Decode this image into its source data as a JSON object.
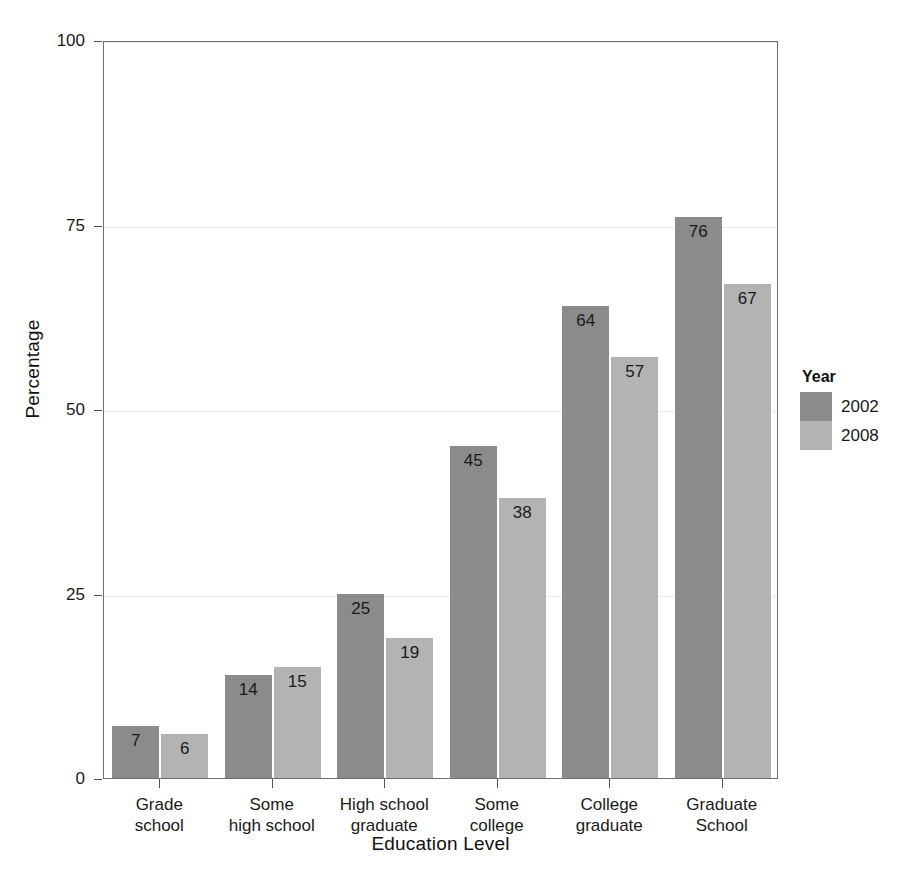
{
  "chart_data": {
    "type": "bar",
    "title": "",
    "xlabel": "Education Level",
    "ylabel": "Percentage",
    "categories": [
      "Grade\nschool",
      "Some\nhigh school",
      "High school\ngraduate",
      "Some\ncollege",
      "College\ngraduate",
      "Graduate\nSchool"
    ],
    "series": [
      {
        "name": "2002",
        "color": "#8b8b8b",
        "values": [
          7,
          14,
          25,
          45,
          64,
          76
        ]
      },
      {
        "name": "2008",
        "color": "#b3b3b3",
        "values": [
          6,
          15,
          19,
          38,
          57,
          67
        ]
      }
    ],
    "ylim": [
      0,
      100
    ],
    "yticks": [
      0,
      25,
      50,
      75,
      100
    ],
    "ytick_labels": [
      "0",
      "25",
      "50",
      "75",
      "100"
    ],
    "grid": true,
    "grid_color": "#ededed",
    "legend": {
      "title": "Year",
      "position": "right",
      "entries": [
        "2002",
        "2008"
      ]
    },
    "bar_value_labels": true,
    "frame_color": "#6f6f6f",
    "background": "#ffffff"
  }
}
